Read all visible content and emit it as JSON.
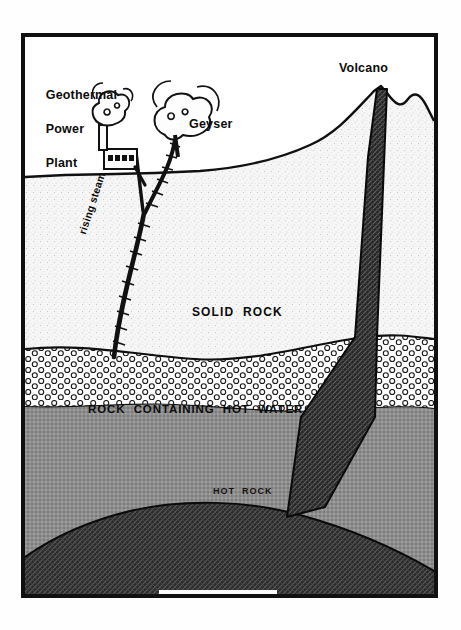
{
  "figure": {
    "kind": "geothermal-cross-section-diagram",
    "frame": {
      "border_color": "#101010",
      "background": "#fdfdfd"
    }
  },
  "labels": {
    "power_plant": "Geothermal\nPower\nPlant",
    "power_plant_line1": "Geothermal",
    "power_plant_line2": "Power",
    "power_plant_line3": "Plant",
    "geyser": "Geyser",
    "volcano": "Volcano",
    "rising_steam": "rising steam",
    "solid_rock": "SOLID  ROCK",
    "hot_water_rock": "ROCK  CONTAINING  HOT  WATER",
    "hot_rock": "HOT  ROCK",
    "melted_rock": "MELTED  ROCK"
  },
  "layers": [
    {
      "name": "sky",
      "label": "",
      "fill": "#ffffff",
      "top_y": 0,
      "bottom_y": 170
    },
    {
      "name": "solid-rock",
      "label": "SOLID  ROCK",
      "fill": "#f2f2f2",
      "top_y": 170,
      "bottom_y": 350
    },
    {
      "name": "hot-water-rock",
      "label": "ROCK  CONTAINING  HOT  WATER",
      "fill": "#fafafa",
      "top_y": 350,
      "bottom_y": 400
    },
    {
      "name": "hot-rock",
      "label": "HOT  ROCK",
      "fill": "#8f8f8f",
      "top_y": 400,
      "bottom_y": 598
    },
    {
      "name": "melted-rock",
      "label": "MELTED  ROCK",
      "fill": "#3a3a3a",
      "top_y": 505,
      "bottom_y": 598
    }
  ],
  "features": [
    {
      "name": "geothermal-power-plant",
      "x": 100,
      "y": 150
    },
    {
      "name": "smokestack-plume",
      "x": 100,
      "y": 110
    },
    {
      "name": "geyser-plume",
      "x": 172,
      "y": 115
    },
    {
      "name": "volcano-peak",
      "x": 383,
      "y": 87
    },
    {
      "name": "magma-conduit",
      "x": 380,
      "y": 300
    },
    {
      "name": "steam-fracture",
      "x": 125,
      "y": 260
    },
    {
      "name": "magma-chamber-dome",
      "x": 215,
      "y": 550
    }
  ],
  "colors": {
    "ink": "#0c0c0c",
    "solid_rock_fill": "#f2f2f2",
    "hot_water_fill": "#fafafa",
    "hot_rock_fill": "#8f8f8f",
    "melted_rock_fill": "#3a3a3a",
    "conduit_fill": "#2e2e2e"
  }
}
